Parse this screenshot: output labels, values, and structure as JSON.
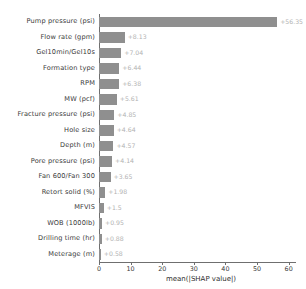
{
  "chart_data": {
    "type": "bar",
    "orientation": "horizontal",
    "title": "",
    "xlabel": "mean(|SHAP value|)",
    "ylabel": "",
    "xlim": [
      0,
      62
    ],
    "xticks": [
      0,
      10,
      20,
      30,
      40,
      50,
      60
    ],
    "xtick_labels": [
      "0",
      "10",
      "20",
      "30",
      "40",
      "50",
      "60"
    ],
    "grid": false,
    "legend": false,
    "bar_color": "#8f8f8f",
    "value_label_color": "#b2b2b2",
    "categories": [
      "Pump pressure (psi)",
      "Flow rate (gpm)",
      "Gel10min/Gel10s",
      "Formation type",
      "RPM",
      "MW (pcf)",
      "Fracture pressure (psi)",
      "Hole size",
      "Depth (m)",
      "Pore pressure (psi)",
      "Fan 600/Fan 300",
      "Retort solid (%)",
      "MFVIS",
      "WOB (1000lb)",
      "Drilling time (hr)",
      "Meterage (m)"
    ],
    "values": [
      56.35,
      8.13,
      7.04,
      6.44,
      6.38,
      5.61,
      4.85,
      4.64,
      4.57,
      4.14,
      3.65,
      1.98,
      1.5,
      0.95,
      0.88,
      0.58
    ],
    "value_labels": [
      "+56.35",
      "+8.13",
      "+7.04",
      "+6.44",
      "+6.38",
      "+5.61",
      "+4.85",
      "+4.64",
      "+4.57",
      "+4.14",
      "+3.65",
      "+1.98",
      "+1.5",
      "+0.95",
      "+0.88",
      "+0.58"
    ]
  }
}
